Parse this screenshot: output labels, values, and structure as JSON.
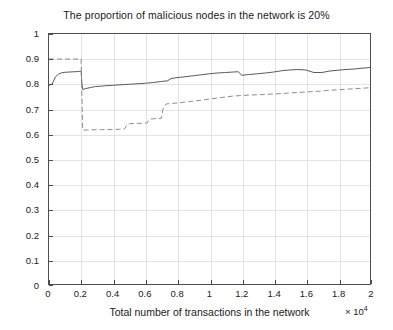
{
  "chart_data": {
    "type": "line",
    "title": "The proportion of malicious nodes in the network is 20%",
    "xlabel": "Total number of transactions in the network",
    "ylabel": "Trust value",
    "x_exponent_label": "× 10",
    "x_exponent_power": "4",
    "xlim": [
      0,
      2
    ],
    "ylim": [
      0,
      1
    ],
    "xticks": [
      0,
      0.2,
      0.4,
      0.6,
      0.8,
      1,
      1.2,
      1.4,
      1.6,
      1.8,
      2
    ],
    "xticklabels": [
      "0",
      "0.2",
      "0.4",
      "0.6",
      "0.8",
      "1",
      "1.2",
      "1.4",
      "1.6",
      "1.8",
      "2"
    ],
    "yticks": [
      0,
      0.1,
      0.2,
      0.3,
      0.4,
      0.5,
      0.6,
      0.7,
      0.8,
      0.9,
      1
    ],
    "yticklabels": [
      "0",
      "0.1",
      "0.2",
      "0.3",
      "0.4",
      "0.5",
      "0.6",
      "0.7",
      "0.8",
      "0.9",
      "1"
    ],
    "grid": true,
    "legend": null,
    "series": [
      {
        "name": "solid-curve",
        "style": "solid",
        "color": "#595959",
        "x": [
          0.0,
          0.02,
          0.04,
          0.06,
          0.08,
          0.1,
          0.13,
          0.16,
          0.185,
          0.195,
          0.2,
          0.205,
          0.21,
          0.23,
          0.26,
          0.29,
          0.32,
          0.35,
          0.4,
          0.45,
          0.5,
          0.55,
          0.6,
          0.65,
          0.7,
          0.74,
          0.76,
          0.78,
          0.82,
          0.86,
          0.9,
          0.95,
          1.0,
          1.05,
          1.1,
          1.15,
          1.18,
          1.2,
          1.25,
          1.3,
          1.35,
          1.4,
          1.44,
          1.46,
          1.5,
          1.55,
          1.6,
          1.65,
          1.7,
          1.75,
          1.8,
          1.85,
          1.9,
          1.95,
          2.0
        ],
        "y": [
          0.795,
          0.8,
          0.828,
          0.84,
          0.845,
          0.847,
          0.848,
          0.849,
          0.85,
          0.851,
          0.851,
          0.8,
          0.778,
          0.782,
          0.786,
          0.79,
          0.791,
          0.793,
          0.795,
          0.797,
          0.799,
          0.801,
          0.803,
          0.806,
          0.81,
          0.813,
          0.822,
          0.824,
          0.827,
          0.83,
          0.833,
          0.837,
          0.841,
          0.844,
          0.846,
          0.848,
          0.849,
          0.835,
          0.838,
          0.841,
          0.844,
          0.848,
          0.852,
          0.854,
          0.856,
          0.858,
          0.856,
          0.846,
          0.846,
          0.852,
          0.855,
          0.858,
          0.86,
          0.863,
          0.866
        ]
      },
      {
        "name": "dashed-curve",
        "style": "dashed",
        "color": "#8c8c8c",
        "x": [
          0.0,
          0.05,
          0.1,
          0.15,
          0.19,
          0.195,
          0.2,
          0.205,
          0.21,
          0.24,
          0.28,
          0.32,
          0.36,
          0.4,
          0.44,
          0.47,
          0.49,
          0.5,
          0.54,
          0.58,
          0.61,
          0.63,
          0.65,
          0.68,
          0.7,
          0.71,
          0.73,
          0.76,
          0.8,
          0.84,
          0.88,
          0.92,
          0.96,
          1.0,
          1.05,
          1.1,
          1.15,
          1.2,
          1.25,
          1.3,
          1.35,
          1.4,
          1.45,
          1.5,
          1.55,
          1.6,
          1.65,
          1.7,
          1.75,
          1.8,
          1.85,
          1.9,
          1.95,
          2.0
        ],
        "y": [
          0.9,
          0.9,
          0.9,
          0.9,
          0.9,
          0.9,
          0.9,
          0.76,
          0.616,
          0.616,
          0.617,
          0.617,
          0.618,
          0.618,
          0.619,
          0.62,
          0.64,
          0.641,
          0.642,
          0.643,
          0.644,
          0.66,
          0.661,
          0.662,
          0.663,
          0.7,
          0.72,
          0.722,
          0.724,
          0.727,
          0.73,
          0.733,
          0.736,
          0.74,
          0.744,
          0.748,
          0.752,
          0.754,
          0.756,
          0.757,
          0.758,
          0.76,
          0.762,
          0.764,
          0.766,
          0.768,
          0.77,
          0.772,
          0.775,
          0.777,
          0.779,
          0.781,
          0.783,
          0.785
        ]
      }
    ]
  }
}
